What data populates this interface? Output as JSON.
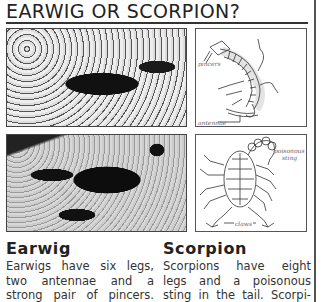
{
  "title": "EARWIG OR SCORPION?",
  "figures": {
    "earwig_photo": {
      "alt": "earwig-photo"
    },
    "earwig_diagram": {
      "labels": {
        "pincers": "pincers",
        "antennae": "antennae"
      }
    },
    "scorpion_photo": {
      "alt": "scorpion-photo"
    },
    "scorpion_diagram": {
      "labels": {
        "sting_line1": "poisonous",
        "sting_line2": "sting",
        "claws": "claws"
      }
    }
  },
  "columns": [
    {
      "heading": "Earwig",
      "lines": [
        "Earwigs have six legs,",
        "two antennae and a",
        "strong pair of pincers."
      ]
    },
    {
      "heading": "Scorpion",
      "lines": [
        "Scorpions have eight",
        "legs and a poisonous",
        "sting in the tail. Scorpi-"
      ]
    }
  ]
}
